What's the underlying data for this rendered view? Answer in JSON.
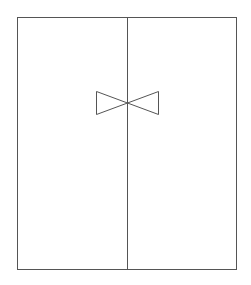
{
  "diagram": {
    "type": "door-with-bowtie-symbol",
    "stroke_color": "#555555",
    "background_color": "#ffffff",
    "frame": {
      "x": 17,
      "y": 17,
      "width": 219,
      "height": 252
    },
    "divider": {
      "x": 127,
      "y1": 17,
      "y2": 269
    },
    "bowtie": {
      "center": {
        "x": 127,
        "y": 103
      },
      "left_x": 96,
      "right_x": 158,
      "top_y": 91,
      "bottom_y": 114
    }
  }
}
